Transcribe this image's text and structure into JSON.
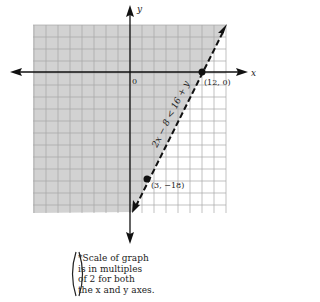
{
  "chart_data": {
    "type": "line",
    "title": "",
    "xlabel": "x",
    "ylabel": "y",
    "origin_label": "0",
    "grid": true,
    "grid_scale": 2,
    "xlim": [
      -16,
      16
    ],
    "ylim": [
      -24,
      8
    ],
    "inequality": "2x − 8 < 16 + y",
    "boundary_line": {
      "equation": "y = 2x − 24",
      "style": "dashed",
      "points": [
        [
          12,
          0
        ],
        [
          3,
          -18
        ]
      ]
    },
    "shaded_region": "left/above boundary (y > 2x − 24)",
    "points": [
      {
        "x": 12,
        "y": 0,
        "label": "(12, 0)"
      },
      {
        "x": 3,
        "y": -18,
        "label": "(3, −18)"
      }
    ],
    "colors": {
      "shade": "#d2d2d2",
      "grid": "#a8a8a8",
      "axis": "#111111"
    }
  },
  "note": {
    "lines": [
      "*Scale of graph",
      "is in multiples",
      "of 2 for both",
      "the x and y axes."
    ]
  }
}
